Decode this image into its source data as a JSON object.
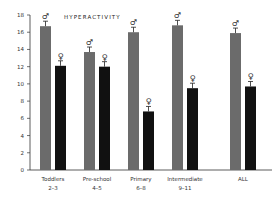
{
  "chart_data": {
    "type": "bar",
    "title": "HYPERACTIVITY",
    "xlabel": "",
    "ylabel": "",
    "ylim": [
      0,
      18
    ],
    "yticks": [
      0,
      2,
      4,
      6,
      8,
      10,
      12,
      14,
      16,
      18
    ],
    "categories": [
      "Toddlers 2–3",
      "Pre-school 4–5",
      "Primary 6–8",
      "Intermediate 9–11",
      "ALL"
    ],
    "category_lines": [
      [
        "Toddlers",
        "2–3"
      ],
      [
        "Pre-school",
        "4–5"
      ],
      [
        "Primary",
        "6–8"
      ],
      [
        "Intermediate",
        "9–11"
      ],
      [
        "ALL",
        ""
      ]
    ],
    "series": [
      {
        "name": "Male (♂)",
        "symbol": "♂",
        "color": "#6b6b6b",
        "values": [
          16.7,
          13.7,
          16.0,
          16.8,
          15.9
        ]
      },
      {
        "name": "Female (♀)",
        "symbol": "♀",
        "color": "#111111",
        "values": [
          12.1,
          12.0,
          6.8,
          9.5,
          9.7
        ]
      }
    ],
    "error_bars": true,
    "grid": false,
    "legend": "symbols above bars"
  }
}
